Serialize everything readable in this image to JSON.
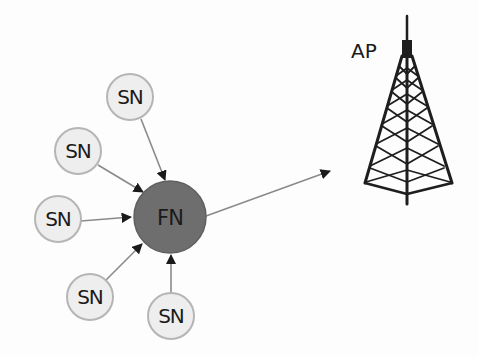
{
  "diagram": {
    "colors": {
      "sn_fill": "#eeeeee",
      "sn_stroke": "#b5b5b5",
      "fn_fill": "#6e6e6e",
      "fn_stroke": "#5a5a5a",
      "edge": "#8a8a8a",
      "arrowhead": "#1a1a1a",
      "tower": "#1e1e1e"
    },
    "fog_node": {
      "label": "FN"
    },
    "sensor_nodes": [
      {
        "label": "SN"
      },
      {
        "label": "SN"
      },
      {
        "label": "SN"
      },
      {
        "label": "SN"
      },
      {
        "label": "SN"
      }
    ],
    "access_point": {
      "label": "AP",
      "icon": "radio-tower-icon"
    }
  }
}
